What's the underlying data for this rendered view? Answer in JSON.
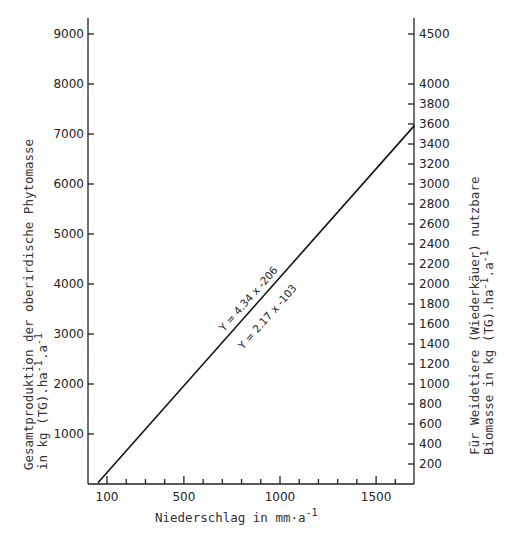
{
  "chart_data": {
    "type": "line",
    "title": "",
    "xlabel": "Niederschlag in mm·a",
    "xlabel_sup": "-1",
    "ylabel_left_line1": "Gesamtproduktion der oberirdische Phytomasse",
    "ylabel_left_line2": "in kg (TG).ha",
    "ylabel_left_line2_sup1": "-1",
    "ylabel_left_line2_mid": ".a",
    "ylabel_left_line2_sup2": "-1",
    "ylabel_right_line1": "Für Weidetiere (Wiederkäuer) nutzbare",
    "ylabel_right_line2": "Biomasse in kg (TG).ha",
    "ylabel_right_line2_sup1": "-1",
    "ylabel_right_line2_mid": ".a",
    "ylabel_right_line2_sup2": "-1",
    "xlim": [
      53,
      1700
    ],
    "ylim_left": [
      0,
      9300
    ],
    "ylim_right": [
      0,
      4650
    ],
    "x_ticks_major": [
      100,
      500,
      1000,
      1500
    ],
    "x_ticks_minor": [
      200,
      300,
      400,
      600,
      700,
      800,
      900,
      1100,
      1200,
      1300,
      1400,
      1600
    ],
    "y_ticks_left": [
      1000,
      2000,
      3000,
      4000,
      5000,
      6000,
      7000,
      8000,
      9000
    ],
    "y_ticks_right": [
      200,
      400,
      600,
      800,
      1000,
      1200,
      1400,
      1600,
      1800,
      2000,
      2200,
      2400,
      2600,
      2800,
      3000,
      3200,
      3400,
      3600,
      3800,
      4000,
      4500
    ],
    "grid": false,
    "legend": null,
    "series": [
      {
        "name": "Gesamtproduktion (links)",
        "equation": "Y = 4.34 x -206",
        "axis": "left",
        "x": [
          53,
          1700
        ],
        "values": [
          24,
          7172
        ]
      },
      {
        "name": "Nutzbare Biomasse (rechts)",
        "equation": "Y = 2.17 x -103",
        "axis": "right",
        "x": [
          53,
          1700
        ],
        "values": [
          12,
          3586
        ]
      }
    ],
    "annotations": [
      {
        "text": "Y = 4.34 x -206",
        "position": "above line",
        "x_approx": 800
      },
      {
        "text": "Y = 2.17 x -103",
        "position": "below line",
        "x_approx": 850
      }
    ]
  }
}
